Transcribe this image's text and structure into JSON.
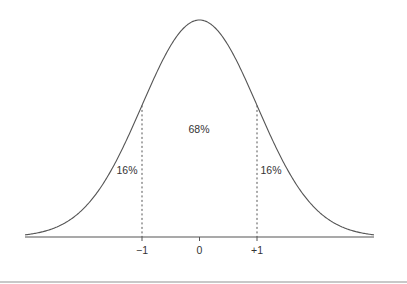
{
  "chart_data": {
    "type": "line",
    "title": "",
    "subtitle": "Normal distribution (bell curve)",
    "xlabel": "",
    "ylabel": "",
    "xlim": [
      -3,
      3
    ],
    "grid": false,
    "legend": null,
    "x_ticks": [
      {
        "value": -1,
        "label": "−1"
      },
      {
        "value": 0,
        "label": "0"
      },
      {
        "value": 1,
        "label": "+1"
      }
    ],
    "series": [
      {
        "name": "standard normal density",
        "function": "exp(-x^2/2)/sqrt(2*pi)"
      }
    ],
    "reference_lines": [
      {
        "x": -1,
        "style": "dashed"
      },
      {
        "x": 1,
        "style": "dashed"
      }
    ],
    "annotations": [
      {
        "text": "16%",
        "region": "x < -1"
      },
      {
        "text": "68%",
        "region": "-1 < x < +1"
      },
      {
        "text": "16%",
        "region": "x > +1"
      }
    ]
  },
  "labels": {
    "left_tail": "16%",
    "center": "68%",
    "right_tail": "16%",
    "tick_minus1": "−1",
    "tick_0": "0",
    "tick_plus1": "+1"
  },
  "colors": {
    "curve": "#555555",
    "axis": "#555555",
    "text": "#333333"
  }
}
